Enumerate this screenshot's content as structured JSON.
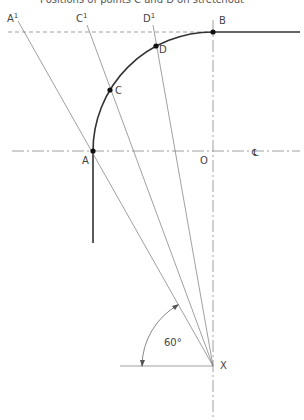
{
  "caption": "Positions of points C and D on stretchout",
  "points": {
    "A": {
      "label": "A",
      "x": 93,
      "y": 151
    },
    "B": {
      "label": "B",
      "x": 213,
      "y": 32
    },
    "C": {
      "label": "C",
      "x": 110,
      "y": 90
    },
    "D": {
      "label": "D",
      "x": 156,
      "y": 46
    },
    "O": {
      "label": "O",
      "x": 213,
      "y": 151
    },
    "X": {
      "label": "X",
      "x": 213,
      "y": 366
    }
  },
  "projected": {
    "A1": {
      "label": "A",
      "sup": "1"
    },
    "C1": {
      "label": "C",
      "sup": "1"
    },
    "D1": {
      "label": "D",
      "sup": "1"
    }
  },
  "centerline_symbol": "℄",
  "angle_label": "60°",
  "colors": {
    "line": "#333333",
    "thin": "#777777",
    "text": "#444444"
  }
}
